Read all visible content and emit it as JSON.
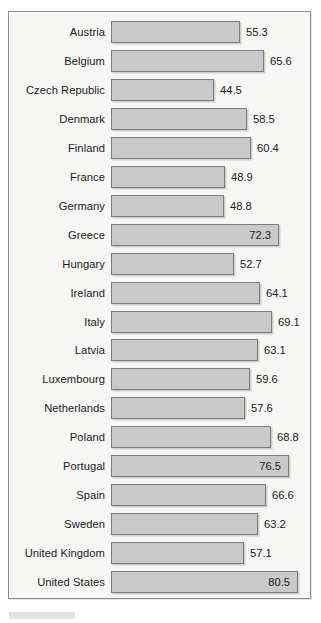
{
  "chart_data": {
    "type": "bar",
    "orientation": "horizontal",
    "title": "",
    "subtitle": "",
    "xlabel": "",
    "ylabel": "",
    "xlim": [
      0,
      85
    ],
    "grid": false,
    "legend": null,
    "value_label_precision": 1,
    "categories": [
      "Austria",
      "Belgium",
      "Czech Republic",
      "Denmark",
      "Finland",
      "France",
      "Germany",
      "Greece",
      "Hungary",
      "Ireland",
      "Italy",
      "Latvia",
      "Luxembourg",
      "Netherlands",
      "Poland",
      "Portugal",
      "Spain",
      "Sweden",
      "United Kingdom",
      "United States"
    ],
    "values": [
      55.3,
      65.6,
      44.5,
      58.5,
      60.4,
      48.9,
      48.8,
      72.3,
      52.7,
      64.1,
      69.1,
      63.1,
      59.6,
      57.6,
      68.8,
      76.5,
      66.6,
      63.2,
      57.1,
      80.5
    ],
    "value_labels": [
      "55.3",
      "65.6",
      "44.5",
      "58.5",
      "60.4",
      "48.9",
      "48.8",
      "72.3",
      "52.7",
      "64.1",
      "69.1",
      "63.1",
      "59.6",
      "57.6",
      "68.8",
      "76.5",
      "66.6",
      "63.2",
      "57.1",
      "80.5"
    ],
    "label_inside_bar": [
      false,
      false,
      false,
      false,
      false,
      false,
      false,
      true,
      false,
      false,
      false,
      false,
      false,
      false,
      false,
      true,
      false,
      false,
      false,
      true
    ],
    "colors": {
      "bar_fill": "#c9c9c9",
      "bar_border": "#7d7d7d",
      "plot_background": "#f7f7f5",
      "frame_border": "#8e8e8e",
      "text": "#1b1b1b"
    }
  }
}
